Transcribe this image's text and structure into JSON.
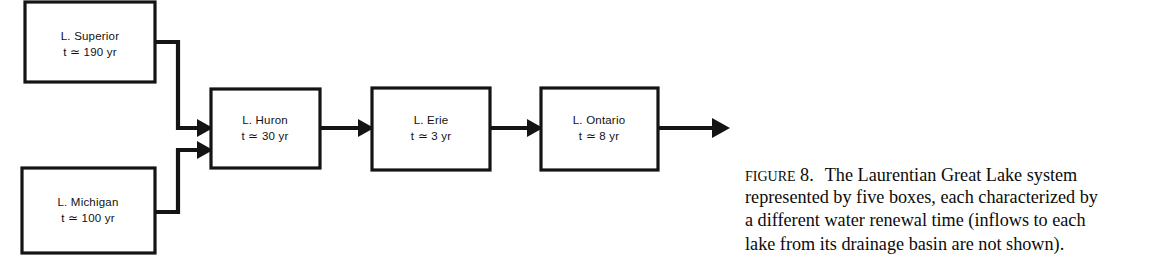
{
  "figure": {
    "label_word": "Figure",
    "number": "8.",
    "caption_lines": [
      "The Laurentian Great Lake system",
      "represented by five boxes, each characterized by",
      "a different water renewal time (inflows to each",
      "lake from its drainage basin are not shown)."
    ],
    "caption_full": "FIGURE 8. The Laurentian Great Lake system represented by five boxes, each characterized by a different water renewal time (inflows to each lake from its drainage basin are not shown)."
  },
  "colors": {
    "background": "#ffffff",
    "ink": "#141414",
    "box_fill": "#ffffff",
    "text": "#111111"
  },
  "diagram": {
    "type": "flow-diagram",
    "title": "Laurentian Great Lake system",
    "nodes": [
      {
        "id": "superior",
        "name": "L. Superior",
        "residence_time_label": "t ≃ 190 yr",
        "residence_time_years": 190,
        "x": 25,
        "y": 2,
        "w": 130,
        "h": 80
      },
      {
        "id": "michigan",
        "name": "L. Michigan",
        "residence_time_label": "t ≃ 100 yr",
        "residence_time_years": 100,
        "x": 22,
        "y": 168,
        "w": 133,
        "h": 85
      },
      {
        "id": "huron",
        "name": "L. Huron",
        "residence_time_label": "t ≃ 30 yr",
        "residence_time_years": 30,
        "x": 211,
        "y": 89,
        "w": 109,
        "h": 79
      },
      {
        "id": "erie",
        "name": "L. Erie",
        "residence_time_label": "t ≃ 3 yr",
        "residence_time_years": 3,
        "x": 372,
        "y": 88,
        "w": 118,
        "h": 82
      },
      {
        "id": "ontario",
        "name": "L. Ontario",
        "residence_time_label": "t ≃ 8 yr",
        "residence_time_years": 8,
        "x": 541,
        "y": 88,
        "w": 117,
        "h": 82
      }
    ],
    "edges": [
      {
        "id": "superior-to-huron",
        "from": "superior",
        "to": "huron"
      },
      {
        "id": "michigan-to-huron",
        "from": "michigan",
        "to": "huron"
      },
      {
        "id": "huron-to-erie",
        "from": "huron",
        "to": "erie"
      },
      {
        "id": "erie-to-ontario",
        "from": "erie",
        "to": "ontario"
      },
      {
        "id": "ontario-outflow",
        "from": "ontario",
        "to": "outflow"
      }
    ]
  }
}
